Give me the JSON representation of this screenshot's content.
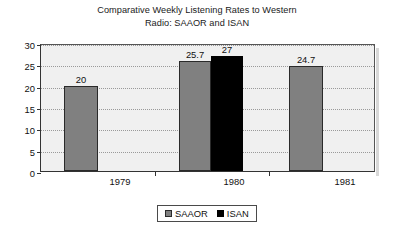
{
  "chart_data": {
    "type": "bar",
    "title": "Comparative Weekly Listening Rates to Western Radio: SAAOR and ISAN",
    "title_lines": [
      "Comparative Weekly Listening Rates to Western",
      "Radio: SAAOR and ISAN"
    ],
    "xlabel": "",
    "ylabel": "",
    "categories": [
      "1979",
      "1980",
      "1981"
    ],
    "series": [
      {
        "name": "SAAOR",
        "color": "#808080",
        "values": [
          20,
          25.7,
          24.7
        ]
      },
      {
        "name": "ISAN",
        "color": "#000000",
        "values": [
          null,
          27,
          null
        ]
      }
    ],
    "bars": [
      {
        "category": "1979",
        "series": "SAAOR",
        "value": 20,
        "label": "20",
        "color": "#808080"
      },
      {
        "category": "1980",
        "series": "SAAOR",
        "value": 25.7,
        "label": "25.7",
        "color": "#808080"
      },
      {
        "category": "1980",
        "series": "ISAN",
        "value": 27,
        "label": "27",
        "color": "#000000"
      },
      {
        "category": "1981",
        "series": "SAAOR",
        "value": 24.7,
        "label": "24.7",
        "color": "#808080"
      }
    ],
    "ylim": [
      0,
      30
    ],
    "ytick_step": 5,
    "yticks": [
      "0",
      "5",
      "10",
      "15",
      "20",
      "25",
      "30"
    ],
    "grid": true,
    "grid_style": "dotted",
    "legend_position": "bottom-center",
    "legend": [
      {
        "label": "SAAOR",
        "color": "#808080"
      },
      {
        "label": "ISAN",
        "color": "#000000"
      }
    ],
    "plot_background": "#f0f0f0",
    "figure_background": "#ffffff"
  }
}
